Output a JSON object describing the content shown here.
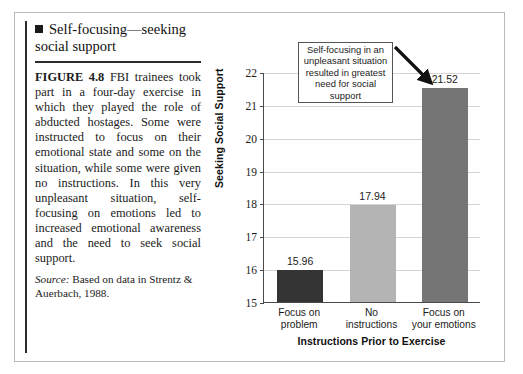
{
  "figure": {
    "heading": "Self-focusing—seeking social support",
    "heading_bullet_icon": "filled-square-bullet",
    "caption_figure_number": "FIGURE 4.8",
    "caption_body": "FBI trainees took part in a four-day exercise in which they played the role of abducted hostages. Some were instructed to focus on their emotional state and some on the situation, while some were given no instructions. In this very unpleasant situation, self-focusing on emotions led to increased emotional awareness and the need to seek social support.",
    "source_lead": "Source:",
    "source_text": "Based on data in Strentz & Auerbach, 1988."
  },
  "callout": {
    "text": "Self-focusing in an unpleasant situation resulted in greatest need for social support",
    "arrow_icon": "arrow-down-right-icon"
  },
  "chart_data": {
    "type": "bar",
    "title": "",
    "categories": [
      "Focus on problem",
      "No instructions",
      "Focus on your emotions"
    ],
    "category_lines": [
      [
        "Focus on",
        "problem"
      ],
      [
        "No",
        "instructions"
      ],
      [
        "Focus on",
        "your emotions"
      ]
    ],
    "values": [
      15.96,
      17.94,
      21.52
    ],
    "value_labels": [
      "15.96",
      "17.94",
      "21.52"
    ],
    "bar_colors": [
      "#343434",
      "#b4b4b4",
      "#757575"
    ],
    "xlabel": "Instructions Prior to Exercise",
    "ylabel": "Seeking Social Support",
    "ylim": [
      15,
      22
    ],
    "yticks": [
      15,
      16,
      17,
      18,
      19,
      20,
      21,
      22
    ],
    "ytick_labels": [
      "15",
      "16",
      "17",
      "18",
      "19",
      "20",
      "21",
      "22"
    ],
    "grid": true,
    "legend": "none"
  },
  "colors": {
    "frame_border": "#b9b9b9",
    "axis": "#4a4a4a",
    "gridline": "#d5d5d5",
    "rule": "#2b2b2b"
  }
}
